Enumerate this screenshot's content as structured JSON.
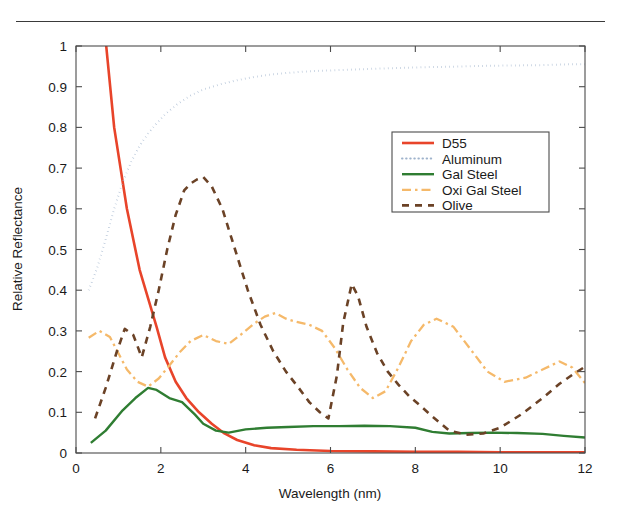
{
  "figure": {
    "top_rule": true,
    "background": "#ffffff"
  },
  "chart_data": {
    "type": "line",
    "title": "",
    "xlabel": "Wavelength (nm)",
    "ylabel": "Relative Reflectance",
    "xlim": [
      0,
      12
    ],
    "ylim": [
      0,
      1
    ],
    "xticks": [
      0,
      2,
      4,
      6,
      8,
      10,
      12
    ],
    "xticklabels": [
      "0",
      "2",
      "4",
      "6",
      "8",
      "10",
      "12"
    ],
    "yticks": [
      0,
      0.1,
      0.2,
      0.3,
      0.4,
      0.5,
      0.6,
      0.7,
      0.8,
      0.9,
      1
    ],
    "yticklabels": [
      "0",
      "0.1",
      "0.2",
      "0.3",
      "0.4",
      "0.5",
      "0.6",
      "0.7",
      "0.8",
      "0.9",
      "1"
    ],
    "grid": false,
    "legend_position": "upper right",
    "series": [
      {
        "name": "D55",
        "color": "#e8442a",
        "style": "solid",
        "linewidth": 2.6,
        "x": [
          0.35,
          0.6,
          0.9,
          1.2,
          1.5,
          1.7,
          1.9,
          2.1,
          2.35,
          2.6,
          2.9,
          3.2,
          3.5,
          3.8,
          4.2,
          4.6,
          5.2,
          6.0,
          7.0,
          8.0,
          9.0,
          10.0,
          11.0,
          12.0
        ],
        "y": [
          1.34,
          1.12,
          0.8,
          0.6,
          0.45,
          0.38,
          0.31,
          0.235,
          0.175,
          0.135,
          0.1,
          0.072,
          0.048,
          0.032,
          0.019,
          0.012,
          0.008,
          0.005,
          0.004,
          0.003,
          0.003,
          0.002,
          0.002,
          0.002
        ]
      },
      {
        "name": "Aluminum",
        "color": "#9fb3cc",
        "style": "dotted",
        "linewidth": 2.0,
        "x": [
          0.3,
          0.5,
          0.7,
          0.9,
          1.1,
          1.3,
          1.5,
          1.7,
          1.9,
          2.1,
          2.4,
          2.7,
          3.0,
          3.4,
          3.8,
          4.2,
          4.6,
          5.0,
          5.5,
          6.0,
          6.5,
          7.0,
          7.6,
          8.2,
          8.8,
          9.5,
          10.2,
          11.0,
          11.6,
          12.0
        ],
        "y": [
          0.4,
          0.455,
          0.525,
          0.6,
          0.665,
          0.715,
          0.755,
          0.785,
          0.81,
          0.832,
          0.858,
          0.878,
          0.893,
          0.906,
          0.916,
          0.924,
          0.93,
          0.934,
          0.938,
          0.94,
          0.942,
          0.944,
          0.946,
          0.948,
          0.949,
          0.951,
          0.952,
          0.953,
          0.955,
          0.955
        ]
      },
      {
        "name": "Gal Steel",
        "color": "#2f7d32",
        "style": "solid",
        "linewidth": 2.4,
        "x": [
          0.35,
          0.7,
          1.1,
          1.4,
          1.7,
          1.9,
          2.2,
          2.5,
          2.8,
          3.0,
          3.3,
          3.6,
          4.0,
          4.5,
          5.0,
          5.6,
          6.2,
          6.8,
          7.4,
          8.0,
          8.4,
          8.8,
          9.3,
          9.8,
          10.4,
          11.0,
          11.5,
          12.0
        ],
        "y": [
          0.025,
          0.055,
          0.105,
          0.135,
          0.16,
          0.155,
          0.135,
          0.125,
          0.095,
          0.072,
          0.055,
          0.05,
          0.058,
          0.062,
          0.064,
          0.066,
          0.066,
          0.067,
          0.066,
          0.062,
          0.052,
          0.048,
          0.049,
          0.05,
          0.049,
          0.047,
          0.042,
          0.038
        ]
      },
      {
        "name": "Oxi Gal Steel",
        "color": "#f5b96a",
        "style": "dashdot",
        "linewidth": 2.3,
        "x": [
          0.3,
          0.55,
          0.8,
          1.0,
          1.2,
          1.45,
          1.7,
          1.95,
          2.2,
          2.45,
          2.7,
          3.0,
          3.3,
          3.6,
          3.9,
          4.2,
          4.45,
          4.7,
          4.95,
          5.2,
          5.5,
          5.8,
          6.1,
          6.4,
          6.7,
          7.0,
          7.3,
          7.6,
          7.9,
          8.2,
          8.5,
          8.9,
          9.3,
          9.7,
          10.1,
          10.6,
          11.0,
          11.4,
          11.7,
          12.0
        ],
        "y": [
          0.283,
          0.3,
          0.285,
          0.245,
          0.205,
          0.175,
          0.163,
          0.183,
          0.215,
          0.248,
          0.275,
          0.29,
          0.275,
          0.268,
          0.292,
          0.318,
          0.335,
          0.344,
          0.33,
          0.322,
          0.315,
          0.3,
          0.258,
          0.205,
          0.16,
          0.135,
          0.152,
          0.21,
          0.275,
          0.315,
          0.33,
          0.31,
          0.255,
          0.2,
          0.175,
          0.185,
          0.205,
          0.225,
          0.21,
          0.172
        ]
      },
      {
        "name": "Olive",
        "color": "#6b4226",
        "style": "dashed",
        "linewidth": 2.6,
        "x": [
          0.45,
          0.7,
          0.95,
          1.15,
          1.35,
          1.55,
          1.75,
          1.95,
          2.15,
          2.35,
          2.55,
          2.7,
          2.85,
          3.0,
          3.2,
          3.45,
          3.75,
          4.05,
          4.35,
          4.65,
          4.95,
          5.25,
          5.5,
          5.75,
          5.95,
          6.15,
          6.3,
          6.5,
          6.65,
          6.85,
          7.1,
          7.35,
          7.6,
          7.85,
          8.1,
          8.4,
          8.8,
          9.2,
          9.6,
          10.0,
          10.5,
          11.0,
          11.4,
          11.7,
          12.0
        ],
        "y": [
          0.085,
          0.16,
          0.245,
          0.305,
          0.29,
          0.235,
          0.31,
          0.4,
          0.5,
          0.585,
          0.645,
          0.662,
          0.672,
          0.678,
          0.655,
          0.6,
          0.5,
          0.4,
          0.315,
          0.25,
          0.2,
          0.16,
          0.125,
          0.1,
          0.085,
          0.19,
          0.32,
          0.415,
          0.385,
          0.31,
          0.245,
          0.2,
          0.168,
          0.14,
          0.118,
          0.09,
          0.055,
          0.045,
          0.048,
          0.062,
          0.095,
          0.135,
          0.17,
          0.192,
          0.212
        ]
      }
    ]
  },
  "legend": {
    "entries": [
      {
        "label": "D55"
      },
      {
        "label": "Aluminum"
      },
      {
        "label": "Gal Steel"
      },
      {
        "label": "Oxi Gal Steel"
      },
      {
        "label": "Olive"
      }
    ]
  }
}
